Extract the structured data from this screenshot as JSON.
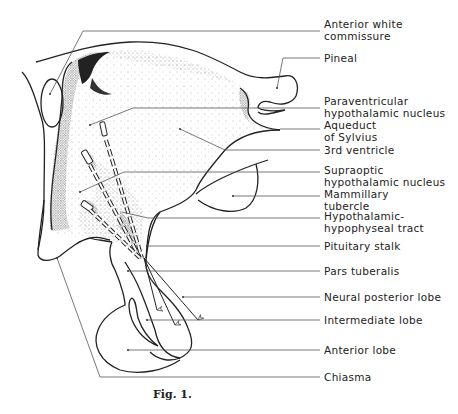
{
  "figure": {
    "caption": "Fig. 1.",
    "labels": [
      {
        "id": "anterior-white-commissure",
        "text": "Anterior white\ncommissure",
        "top": 18
      },
      {
        "id": "pineal",
        "text": "Pineal",
        "top": 52
      },
      {
        "id": "paraventricular-nucleus",
        "text": "Paraventricular\nhypothalamic nucleus",
        "top": 95
      },
      {
        "id": "aqueduct-of-sylvius",
        "text": "Aqueduct\nof Sylvius",
        "top": 119
      },
      {
        "id": "third-ventricle",
        "text": "3rd ventricle",
        "top": 144
      },
      {
        "id": "supraoptic-nucleus",
        "text": "Supraoptic\nhypothalamic nucleus",
        "top": 164
      },
      {
        "id": "mammillary-tubercle",
        "text": "Mammillary\ntubercle",
        "top": 188
      },
      {
        "id": "hypothalamic-hypophyseal-tract",
        "text": "Hypothalamic-\nhypophyseal tract",
        "top": 210
      },
      {
        "id": "pituitary-stalk",
        "text": "Pituitary stalk",
        "top": 237
      },
      {
        "id": "pars-tuberalis",
        "text": "Pars tuberalis",
        "top": 263
      },
      {
        "id": "neural-posterior-lobe",
        "text": "Neural posterior lobe",
        "top": 288
      },
      {
        "id": "intermediate-lobe",
        "text": "Intermediate lobe",
        "top": 311
      },
      {
        "id": "anterior-lobe",
        "text": "Anterior lobe",
        "top": 340
      },
      {
        "id": "chiasma",
        "text": "Chiasma",
        "top": 370
      }
    ]
  }
}
